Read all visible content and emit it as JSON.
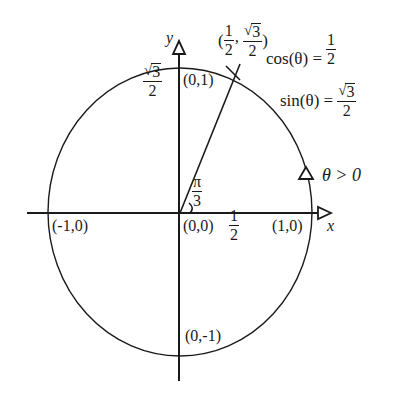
{
  "diagram": {
    "type": "unit-circle",
    "colors": {
      "stroke": "#1a1a1a",
      "background": "#ffffff"
    },
    "axes": {
      "x_label": "x",
      "y_label": "y"
    },
    "points": {
      "origin": "(0,0)",
      "right": "(1,0)",
      "left": "(-1,0)",
      "top": "(0,1)",
      "bottom": "(0,-1)"
    },
    "angle": {
      "numerator": "π",
      "denominator": "3"
    },
    "x_tick": {
      "numerator": "1",
      "denominator": "2"
    },
    "y_tick": {
      "radicand": "3",
      "denominator": "2"
    },
    "point_label": {
      "open": "(",
      "x_num": "1",
      "x_den": "2",
      "comma": ",",
      "y_radicand": "3",
      "y_den": "2",
      "close": ")"
    },
    "cos_eq": {
      "lhs": "cos(θ) =",
      "num": "1",
      "den": "2"
    },
    "sin_eq": {
      "lhs": "sin(θ) =",
      "radicand": "3",
      "den": "2"
    },
    "direction": {
      "label": "θ > 0"
    }
  }
}
